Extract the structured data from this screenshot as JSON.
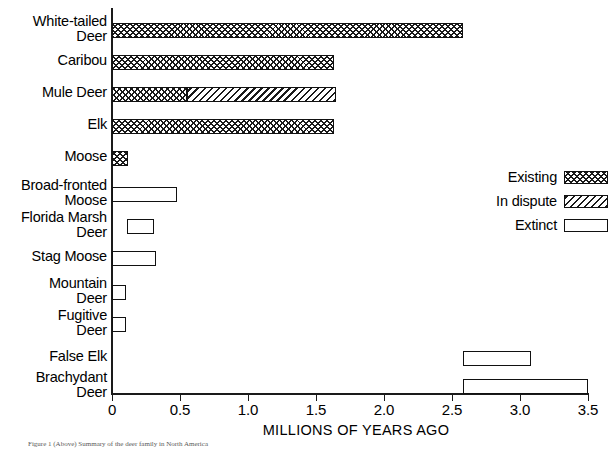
{
  "chart_data": {
    "type": "bar",
    "orientation": "horizontal",
    "title": "",
    "xlabel": "MILLIONS OF YEARS AGO",
    "ylabel": "",
    "xlim": [
      0,
      3.5
    ],
    "xticks": [
      0,
      0.5,
      1.0,
      1.5,
      2.0,
      2.5,
      3.0,
      3.5
    ],
    "xticklabels": [
      "0",
      "0.5",
      "1.0",
      "1.5",
      "2.0",
      "2.5",
      "3.0",
      "3.5"
    ],
    "grid": false,
    "legend_position": "right-middle",
    "legend": [
      {
        "label": "Existing",
        "pattern": "cross-hatch"
      },
      {
        "label": "In dispute",
        "pattern": "diagonal-hatch"
      },
      {
        "label": "Extinct",
        "pattern": "open-white"
      }
    ],
    "categories": [
      "White-tailed\nDeer",
      "Caribou",
      "Mule Deer",
      "Elk",
      "Moose",
      "Broad-fronted\nMoose",
      "Florida Marsh\nDeer",
      "Stag Moose",
      "Mountain\nDeer",
      "Fugitive\nDeer",
      "False Elk",
      "Brachydant\nDeer"
    ],
    "bars": [
      {
        "category": "White-tailed\nDeer",
        "segments": [
          {
            "start": 0.0,
            "end": 2.58,
            "status": "Existing"
          }
        ]
      },
      {
        "category": "Caribou",
        "segments": [
          {
            "start": 0.0,
            "end": 1.63,
            "status": "Existing"
          }
        ]
      },
      {
        "category": "Mule Deer",
        "segments": [
          {
            "start": 0.0,
            "end": 0.55,
            "status": "Existing"
          },
          {
            "start": 0.55,
            "end": 1.65,
            "status": "In dispute"
          }
        ]
      },
      {
        "category": "Elk",
        "segments": [
          {
            "start": 0.0,
            "end": 1.63,
            "status": "Existing"
          }
        ]
      },
      {
        "category": "Moose",
        "segments": [
          {
            "start": 0.0,
            "end": 0.12,
            "status": "Existing"
          }
        ]
      },
      {
        "category": "Broad-fronted\nMoose",
        "segments": [
          {
            "start": 0.0,
            "end": 0.48,
            "status": "Extinct"
          }
        ]
      },
      {
        "category": "Florida Marsh\nDeer",
        "segments": [
          {
            "start": 0.11,
            "end": 0.31,
            "status": "Extinct"
          }
        ]
      },
      {
        "category": "Stag Moose",
        "segments": [
          {
            "start": 0.0,
            "end": 0.32,
            "status": "Extinct"
          }
        ]
      },
      {
        "category": "Mountain\nDeer",
        "segments": [
          {
            "start": 0.0,
            "end": 0.1,
            "status": "Extinct"
          }
        ]
      },
      {
        "category": "Fugitive\nDeer",
        "segments": [
          {
            "start": 0.0,
            "end": 0.1,
            "status": "Extinct"
          }
        ]
      },
      {
        "category": "False Elk",
        "segments": [
          {
            "start": 2.58,
            "end": 3.08,
            "status": "Extinct"
          }
        ]
      },
      {
        "category": "Brachydant\nDeer",
        "segments": [
          {
            "start": 2.58,
            "end": 3.5,
            "status": "Extinct"
          }
        ]
      }
    ],
    "colors": {
      "ink": "#111111",
      "background": "#ffffff"
    }
  },
  "caption": {
    "text": "Figure 1 (Above) Summary of the deer family in North America"
  }
}
